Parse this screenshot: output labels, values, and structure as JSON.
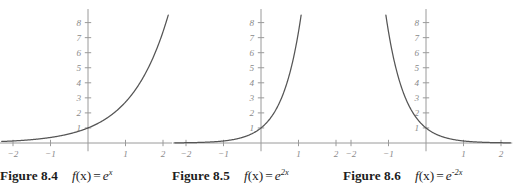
{
  "page": {
    "kind": "textbook-figure-row",
    "background": "#ffffff",
    "axis_color": "#9a9a9a",
    "curve_color": "#555555",
    "tick_label_color": "#8a8a8a",
    "caption_color": "#1d1d1d"
  },
  "figures": [
    {
      "id": "figure-8-4",
      "caption_label": "Figure 8.4",
      "expr_prefix": "f",
      "expr_arg": "(x)",
      "expr_eq": "=",
      "expr_base": "e",
      "expr_exponent": "x",
      "caption_full": "Figure 8.4   f(x) = e^x",
      "chart_data": {
        "type": "line",
        "title": "f(x) = e^x",
        "function": "e^x",
        "xlabel": "",
        "ylabel": "",
        "xlim": [
          -2.35,
          2.3
        ],
        "ylim": [
          -0.55,
          8.9
        ],
        "grid": false,
        "legend": null,
        "xticks": [
          -2,
          -1,
          1,
          2
        ],
        "xtick_labels": [
          "-2",
          "-1",
          "1",
          "2"
        ],
        "yticks": [
          1,
          2,
          3,
          4,
          5,
          6,
          7,
          8
        ],
        "ytick_labels": [
          "1",
          "2",
          "3",
          "4",
          "5",
          "6",
          "7",
          "8"
        ],
        "series": [
          {
            "name": "e^x",
            "x": [
              -2.3,
              -2.0,
              -1.75,
              -1.5,
              -1.25,
              -1.0,
              -0.75,
              -0.5,
              -0.25,
              0.0,
              0.25,
              0.5,
              0.75,
              1.0,
              1.25,
              1.5,
              1.75,
              2.0,
              2.14
            ],
            "y": [
              0.1,
              0.135,
              0.174,
              0.223,
              0.287,
              0.368,
              0.472,
              0.607,
              0.779,
              1.0,
              1.284,
              1.649,
              2.117,
              2.718,
              3.49,
              4.482,
              5.755,
              7.389,
              8.5
            ]
          }
        ]
      }
    },
    {
      "id": "figure-8-5",
      "caption_label": "Figure 8.5",
      "expr_prefix": "f",
      "expr_arg": "(x)",
      "expr_eq": "=",
      "expr_base": "e",
      "expr_exponent": "2x",
      "caption_full": "Figure 8.5   f(x) = e^{2x}",
      "chart_data": {
        "type": "line",
        "title": "f(x) = e^{2x}",
        "function": "e^(2x)",
        "xlabel": "",
        "ylabel": "",
        "xlim": [
          -2.35,
          2.3
        ],
        "ylim": [
          -0.55,
          8.9
        ],
        "grid": false,
        "legend": null,
        "xticks": [
          -2,
          -1,
          1,
          2
        ],
        "xtick_labels": [
          "-2",
          "-1",
          "1",
          "2"
        ],
        "yticks": [
          1,
          2,
          3,
          4,
          5,
          6,
          7,
          8
        ],
        "ytick_labels": [
          "1",
          "2",
          "3",
          "4",
          "5",
          "6",
          "7",
          "8"
        ],
        "series": [
          {
            "name": "e^(2x)",
            "x": [
              -2.3,
              -2.0,
              -1.75,
              -1.5,
              -1.25,
              -1.0,
              -0.75,
              -0.5,
              -0.25,
              0.0,
              0.2,
              0.4,
              0.6,
              0.8,
              1.0,
              1.07
            ],
            "y": [
              0.01,
              0.018,
              0.03,
              0.05,
              0.082,
              0.135,
              0.223,
              0.368,
              0.607,
              1.0,
              1.492,
              2.226,
              3.32,
              4.953,
              7.389,
              8.5
            ]
          }
        ]
      }
    },
    {
      "id": "figure-8-6",
      "caption_label": "Figure 8.6",
      "expr_prefix": "f",
      "expr_arg": "(x)",
      "expr_eq": "=",
      "expr_base": "e",
      "expr_exponent": "-2x",
      "caption_full": "Figure 8.6   f(x) = e^{-2x}",
      "chart_data": {
        "type": "line",
        "title": "f(x) = e^{-2x}",
        "function": "e^(-2x)",
        "xlabel": "",
        "ylabel": "",
        "xlim": [
          -2.35,
          2.3
        ],
        "ylim": [
          -0.55,
          8.9
        ],
        "grid": false,
        "legend": null,
        "xticks": [
          -2,
          -1,
          1,
          2
        ],
        "xtick_labels": [
          "-2",
          "-1",
          "1",
          "2"
        ],
        "yticks": [
          1,
          2,
          3,
          4,
          5,
          6,
          7,
          8
        ],
        "ytick_labels": [
          "1",
          "2",
          "3",
          "4",
          "5",
          "6",
          "7",
          "8"
        ],
        "series": [
          {
            "name": "e^(-2x)",
            "x": [
              -1.07,
              -1.0,
              -0.8,
              -0.6,
              -0.4,
              -0.2,
              0.0,
              0.25,
              0.5,
              0.75,
              1.0,
              1.25,
              1.5,
              1.75,
              2.0,
              2.25
            ],
            "y": [
              8.5,
              7.389,
              4.953,
              3.32,
              2.226,
              1.492,
              1.0,
              0.607,
              0.368,
              0.223,
              0.135,
              0.082,
              0.05,
              0.03,
              0.018,
              0.011
            ]
          }
        ]
      }
    }
  ]
}
